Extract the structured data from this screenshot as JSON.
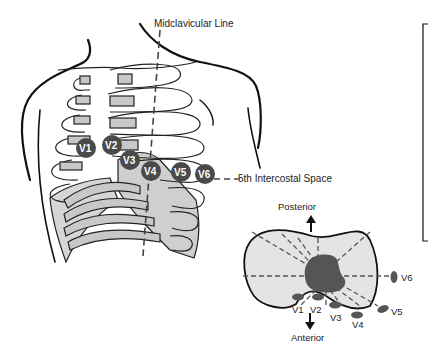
{
  "figure": {
    "labels": {
      "midclavicular": "Midclavicular Line",
      "intercostal": "5th Intercostal Space",
      "posterior": "Posterior",
      "anterior": "Anterior"
    },
    "chest_electrodes": [
      {
        "id": "V1",
        "label": "V1"
      },
      {
        "id": "V2",
        "label": "V2"
      },
      {
        "id": "V3",
        "label": "V3"
      },
      {
        "id": "V4",
        "label": "V4"
      },
      {
        "id": "V5",
        "label": "V5"
      },
      {
        "id": "V6",
        "label": "V6"
      }
    ],
    "cross_section_electrodes": [
      {
        "id": "V1",
        "label": "V1"
      },
      {
        "id": "V2",
        "label": "V2"
      },
      {
        "id": "V3",
        "label": "V3"
      },
      {
        "id": "V4",
        "label": "V4"
      },
      {
        "id": "V5",
        "label": "V5"
      },
      {
        "id": "V6",
        "label": "V6"
      }
    ],
    "colors": {
      "electrode": "#4a4a4a",
      "cartilage": "#c8c8c8",
      "cross_section_fill": "#e4e4e4",
      "heart": "#555555",
      "outline": "#111111"
    }
  }
}
